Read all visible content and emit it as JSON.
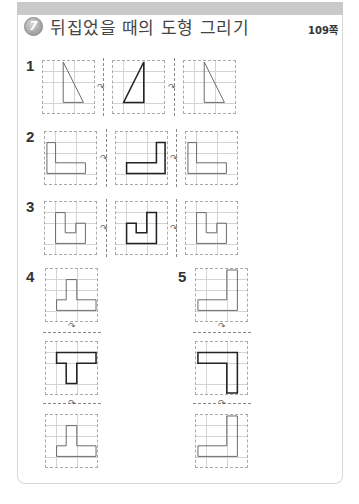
{
  "header": {
    "section_number": "7",
    "title": "뒤집었을 때의 도형 그리기",
    "page_ref": "109쪽"
  },
  "problems": [
    {
      "number": "1",
      "layout": "horizontal",
      "shape": "right-triangle",
      "panels": [
        "original",
        "flipped-left-right (answer, bold)",
        "flipped-back (original)"
      ]
    },
    {
      "number": "2",
      "layout": "horizontal",
      "shape": "L-shape",
      "panels": [
        "original",
        "flipped-left-right (answer, bold)",
        "flipped-back (original)"
      ]
    },
    {
      "number": "3",
      "layout": "horizontal",
      "shape": "U-step-shape",
      "panels": [
        "original",
        "flipped-left-right (answer, bold)",
        "flipped-back (original)"
      ]
    },
    {
      "number": "4",
      "layout": "vertical",
      "shape": "inverted-T",
      "panels": [
        "original",
        "flipped-up-down (answer, bold)",
        "flipped-back (original)"
      ]
    },
    {
      "number": "5",
      "layout": "vertical",
      "shape": "L-shape",
      "panels": [
        "original",
        "flipped-up-down (answer, bold)",
        "flipped-back (original)"
      ]
    }
  ],
  "icons": {
    "flip_arrow": "↷"
  },
  "colors": {
    "topbar": "#c9c9c9",
    "grid_line": "#d4d4d4",
    "shape_stroke": "#666666",
    "answer_stroke": "#222222"
  }
}
